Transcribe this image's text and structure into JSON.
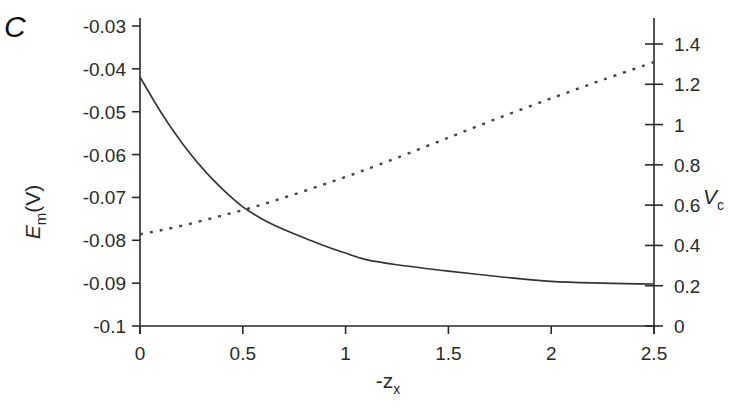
{
  "panel_label": "C",
  "chart_data": {
    "type": "line",
    "title": "",
    "xlabel": "-z",
    "xlabel_subscript": "x",
    "ylabel_left": "E",
    "ylabel_left_subscript": "m",
    "ylabel_left_suffix": "(V)",
    "ylabel_right": "V",
    "ylabel_right_subscript": "c",
    "xlim": [
      0,
      2.5
    ],
    "ylim_left": [
      -0.1,
      -0.03
    ],
    "ylim_right": [
      0,
      1.4
    ],
    "x_ticks": [
      "0",
      "0.5",
      "1",
      "1.5",
      "2",
      "2.5"
    ],
    "x_tick_values": [
      0,
      0.5,
      1,
      1.5,
      2,
      2.5
    ],
    "y_left_ticks": [
      "-0.03",
      "-0.04",
      "-0.05",
      "-0.06",
      "-0.07",
      "-0.08",
      "-0.09",
      "-0.1"
    ],
    "y_left_tick_values": [
      -0.03,
      -0.04,
      -0.05,
      -0.06,
      -0.07,
      -0.08,
      -0.09,
      -0.1
    ],
    "y_right_ticks": [
      "1.4",
      "1.2",
      "1",
      "0.8",
      "0.6",
      "0.4",
      "0.2",
      "0"
    ],
    "y_right_tick_values": [
      1.4,
      1.2,
      1.0,
      0.8,
      0.6,
      0.4,
      0.2,
      0
    ],
    "grid": false,
    "legend": null,
    "x": [
      0,
      0.1,
      0.2,
      0.3,
      0.4,
      0.5,
      0.6,
      0.7,
      0.8,
      0.9,
      1.0,
      1.1,
      1.25,
      1.5,
      1.75,
      2.0,
      2.25,
      2.5
    ],
    "series": [
      {
        "name": "E_m (V)",
        "axis": "left",
        "style": "solid",
        "values": [
          -0.0419,
          -0.05,
          -0.057,
          -0.063,
          -0.068,
          -0.0722,
          -0.0752,
          -0.0775,
          -0.0795,
          -0.0813,
          -0.083,
          -0.0845,
          -0.0857,
          -0.0872,
          -0.0885,
          -0.0896,
          -0.09,
          -0.0902
        ]
      },
      {
        "name": "V_c",
        "axis": "right",
        "style": "dotted",
        "values": [
          0.455,
          0.475,
          0.497,
          0.522,
          0.548,
          0.575,
          0.605,
          0.637,
          0.67,
          0.705,
          0.74,
          0.777,
          0.835,
          0.935,
          1.035,
          1.13,
          1.222,
          1.31
        ]
      }
    ]
  }
}
